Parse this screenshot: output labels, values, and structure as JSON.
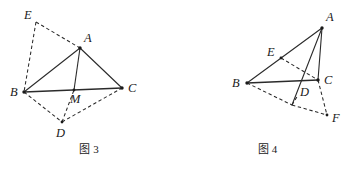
{
  "page": {
    "background": "#ffffff",
    "ink_color": "#2b2b2b"
  },
  "figures": [
    {
      "id": "figure-3",
      "caption_prefix": "图",
      "caption_number": "3",
      "caption_full": "图 3",
      "points": {
        "A": {
          "label": "A",
          "x": 80,
          "y": 48,
          "label_x": 84,
          "label_y": 42
        },
        "B": {
          "label": "B",
          "x": 24,
          "y": 92,
          "label_x": 10,
          "label_y": 96
        },
        "C": {
          "label": "C",
          "x": 122,
          "y": 88,
          "label_x": 128,
          "label_y": 92
        },
        "M": {
          "label": "M",
          "x": 74,
          "y": 90,
          "label_x": 72,
          "label_y": 102
        },
        "D": {
          "label": "D",
          "x": 62,
          "y": 122,
          "label_x": 58,
          "label_y": 136
        },
        "E": {
          "label": "E",
          "x": 36,
          "y": 22,
          "label_x": 26,
          "label_y": 18
        }
      },
      "solid_edges": [
        {
          "name": "edge-AB",
          "from": "A",
          "to": "B"
        },
        {
          "name": "edge-AC",
          "from": "A",
          "to": "C"
        },
        {
          "name": "edge-AM",
          "from": "A",
          "to": "M"
        },
        {
          "name": "edge-BC",
          "from": "B",
          "to": "C"
        }
      ],
      "dashed_edges": [
        {
          "name": "edge-EA",
          "from": "E",
          "to": "A"
        },
        {
          "name": "edge-EB",
          "from": "E",
          "to": "B"
        },
        {
          "name": "edge-BD",
          "from": "B",
          "to": "D"
        },
        {
          "name": "edge-DM",
          "from": "D",
          "to": "M"
        },
        {
          "name": "edge-DC",
          "from": "D",
          "to": "C"
        }
      ]
    },
    {
      "id": "figure-4",
      "caption_prefix": "图",
      "caption_number": "4",
      "caption_full": "图 4",
      "points": {
        "A": {
          "label": "A",
          "x": 144,
          "y": 28,
          "label_x": 148,
          "label_y": 20
        },
        "B": {
          "label": "B",
          "x": 69,
          "y": 83,
          "label_x": 55,
          "label_y": 87
        },
        "C": {
          "label": "C",
          "x": 140,
          "y": 80,
          "label_x": 146,
          "label_y": 83
        },
        "D": {
          "label": "D",
          "x": 120,
          "y": 95,
          "label_x": 124,
          "label_y": 93
        },
        "E": {
          "label": "E",
          "x": 103,
          "y": 58,
          "label_x": 91,
          "label_y": 55
        },
        "F": {
          "label": "F",
          "x": 149,
          "y": 115,
          "label_x": 155,
          "label_y": 121
        },
        "G": {
          "label": "",
          "x": 114,
          "y": 105,
          "label_x": 0,
          "label_y": 0
        }
      },
      "solid_edges": [
        {
          "name": "edge-AB",
          "from": "A",
          "to": "B"
        },
        {
          "name": "edge-AC",
          "from": "A",
          "to": "C"
        },
        {
          "name": "edge-AD",
          "from": "A",
          "to": "D"
        },
        {
          "name": "edge-BC",
          "from": "B",
          "to": "C"
        }
      ],
      "dashed_edges": [
        {
          "name": "edge-EC",
          "from": "E",
          "to": "C"
        },
        {
          "name": "edge-BG",
          "from": "B",
          "to": "G"
        },
        {
          "name": "edge-GD",
          "from": "G",
          "to": "D"
        },
        {
          "name": "edge-GF",
          "from": "G",
          "to": "F"
        },
        {
          "name": "edge-CF",
          "from": "C",
          "to": "F"
        }
      ]
    }
  ]
}
